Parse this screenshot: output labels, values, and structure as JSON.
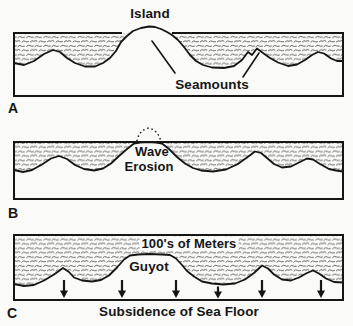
{
  "colors": {
    "paper": "#fafaf8",
    "ink": "#161616"
  },
  "panels": {
    "a": {
      "letter": "A",
      "island_label": "Island",
      "seamounts_label": "Seamounts"
    },
    "b": {
      "letter": "B",
      "wave_erosion_line1": "Wave",
      "wave_erosion_line2": "Erosion"
    },
    "c": {
      "letter": "C",
      "depth_label": "100's of Meters",
      "guyot_label": "Guyot",
      "subsidence_label": "Subsidence of Sea Floor",
      "arrow_count": 6
    }
  }
}
